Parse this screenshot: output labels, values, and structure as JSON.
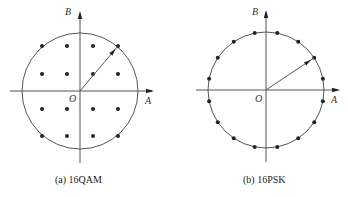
{
  "diagrams": [
    {
      "id": "qam",
      "caption": "(a) 16QAM",
      "axis_labels": {
        "horizontal": "A",
        "vertical": "B",
        "origin": "O"
      },
      "center": [
        80,
        91
      ],
      "radius": 58,
      "points_grid": {
        "xs": [
          42,
          67,
          93,
          118
        ],
        "ys": [
          46,
          74,
          109,
          136
        ]
      },
      "arrow_to": [
        118,
        46
      ]
    },
    {
      "id": "psk",
      "caption": "(b) 16PSK",
      "axis_labels": {
        "horizontal": "A",
        "vertical": "B",
        "origin": "O"
      },
      "center": [
        266,
        90
      ],
      "radius": 58,
      "num_points": 16,
      "angle_offset_deg": 11.25,
      "arrow_angle_deg": 33.75
    }
  ],
  "colors": {
    "ink": "#222222",
    "line": "#555555"
  }
}
